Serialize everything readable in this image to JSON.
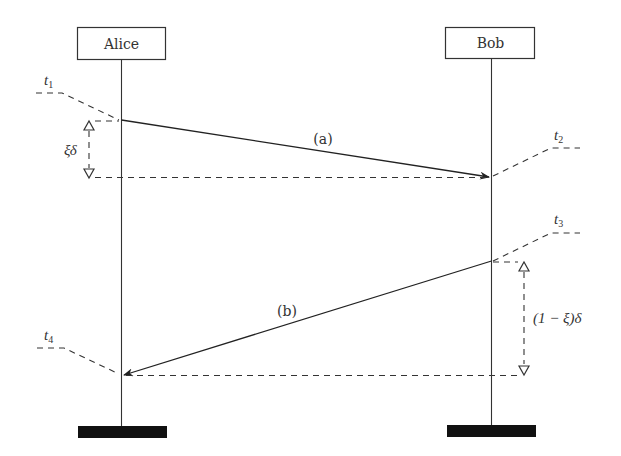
{
  "diagram": {
    "type": "sequence-diagram",
    "participants": [
      {
        "id": "alice",
        "label": "Alice"
      },
      {
        "id": "bob",
        "label": "Bob"
      }
    ],
    "messages": [
      {
        "id": "a",
        "label": "(a)",
        "from": "alice",
        "to": "bob"
      },
      {
        "id": "b",
        "label": "(b)",
        "from": "bob",
        "to": "alice"
      }
    ],
    "time_labels": {
      "t1": {
        "base": "t",
        "sub": "1"
      },
      "t2": {
        "base": "t",
        "sub": "2"
      },
      "t3": {
        "base": "t",
        "sub": "3"
      },
      "t4": {
        "base": "t",
        "sub": "4"
      }
    },
    "intervals": {
      "xi_delta": "ξδ",
      "one_minus_xi_delta": "(1 − ξ)δ"
    },
    "colors": {
      "line": "#222222",
      "bar": "#111111"
    }
  }
}
